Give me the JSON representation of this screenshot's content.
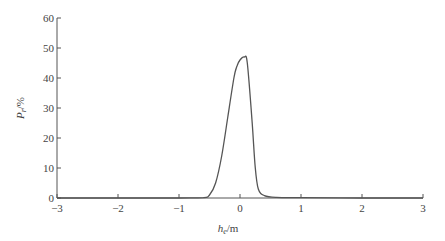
{
  "chart_data": {
    "type": "line",
    "title": "",
    "xlabel": "h_e/m",
    "xlabel_main": "h",
    "xlabel_sub": "e",
    "xlabel_unit": "/m",
    "ylabel": "P_r/%",
    "ylabel_main": "P",
    "ylabel_sub": "r",
    "ylabel_unit": "/%",
    "xlim": [
      -3,
      3
    ],
    "ylim": [
      0,
      60
    ],
    "xticks": [
      -3,
      -2,
      -1,
      0,
      1,
      2,
      3
    ],
    "xtick_labels": [
      "−3",
      "−2",
      "−1",
      "0",
      "1",
      "2",
      "3"
    ],
    "yticks": [
      0,
      10,
      20,
      30,
      40,
      50,
      60
    ],
    "ytick_labels": [
      "0",
      "10",
      "20",
      "30",
      "40",
      "50",
      "60"
    ],
    "grid": false,
    "legend": null,
    "series": [
      {
        "name": "P_r",
        "color": "#555555",
        "x": [
          -3,
          -2,
          -1,
          -0.6,
          -0.5,
          -0.4,
          -0.3,
          -0.2,
          -0.1,
          -0.05,
          0,
          0.07,
          0.12,
          0.2,
          0.25,
          0.3,
          0.4,
          0.6,
          1,
          2,
          3
        ],
        "y": [
          0,
          0,
          0,
          0.1,
          1,
          5,
          14,
          27,
          40,
          44,
          46,
          47,
          45,
          25,
          10,
          3,
          0.8,
          0.2,
          0.1,
          0,
          0
        ]
      }
    ]
  }
}
